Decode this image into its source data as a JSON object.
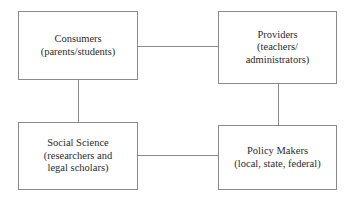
{
  "diagram": {
    "type": "block-diagram",
    "background_color": "#ffffff",
    "line_color": "#8a8a8a",
    "text_color": "#2b2b2b",
    "nodes": [
      {
        "id": "consumers",
        "line1": "Consumers",
        "line2": "(parents/students)",
        "line3": ""
      },
      {
        "id": "providers",
        "line1": "Providers",
        "line2": "(teachers/",
        "line3": "administrators)"
      },
      {
        "id": "social_science",
        "line1": "Social Science",
        "line2": "(researchers and",
        "line3": "legal scholars)"
      },
      {
        "id": "policy_makers",
        "line1": "Policy Makers",
        "line2": "(local, state, federal)",
        "line3": ""
      }
    ],
    "edges": [
      {
        "id": "consumers-providers",
        "from": "consumers",
        "to": "providers",
        "orientation": "horizontal"
      },
      {
        "id": "social-policy",
        "from": "social_science",
        "to": "policy_makers",
        "orientation": "horizontal"
      },
      {
        "id": "consumers-social",
        "from": "consumers",
        "to": "social_science",
        "orientation": "vertical"
      },
      {
        "id": "providers-policy",
        "from": "providers",
        "to": "policy_makers",
        "orientation": "vertical"
      }
    ]
  }
}
